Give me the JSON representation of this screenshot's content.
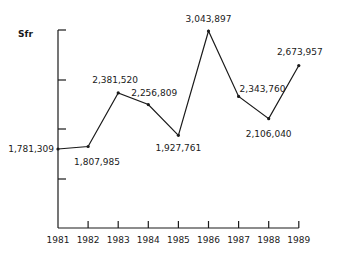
{
  "chart_data": {
    "type": "line",
    "title": "",
    "ylabel": "Sfr",
    "xlabel": "",
    "categories": [
      "1981",
      "1982",
      "1983",
      "1984",
      "1985",
      "1986",
      "1987",
      "1988",
      "1989"
    ],
    "values": [
      1781309,
      1807985,
      2381520,
      2256809,
      1927761,
      3043897,
      2343760,
      2106040,
      2673957
    ],
    "value_labels": [
      "1,781,309",
      "1,807,985",
      "2,381,520",
      "2,256,809",
      "1,927,761",
      "3,043,897",
      "2,343,760",
      "2,106,040",
      "2,673,957"
    ],
    "ylim": [
      1000000,
      3050000
    ],
    "y_ticks_labeled": false,
    "grid": false,
    "legend": null,
    "line_color": "#1a1a1a"
  }
}
